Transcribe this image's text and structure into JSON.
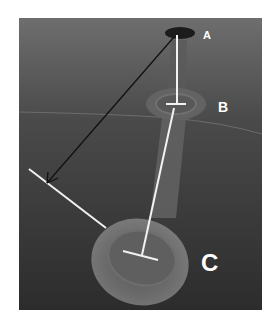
{
  "figure": {
    "labels": {
      "a": "A",
      "b": "B",
      "c": "C"
    },
    "colors": {
      "background_top": "#6a6a6a",
      "background_bottom": "#2e2e2e",
      "tube": "#6b6b6b",
      "bulb": "#747474",
      "bulb_inner": "#5c5c5c",
      "spot_a": "#1c1c1c",
      "measure_line": "#f2f2f2",
      "arrow_line": "#111111",
      "label": "#ffffff"
    }
  }
}
